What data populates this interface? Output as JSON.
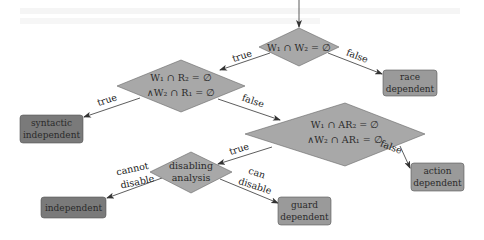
{
  "diagram": {
    "type": "decision-flowchart",
    "colors": {
      "diamond_fill": "#a8a8a8",
      "box_light_fill": "#9a9a9a",
      "box_dark_fill": "#7a7a7a",
      "stroke": "#555555",
      "edge": "#333333"
    },
    "decisions": {
      "d1": {
        "line1": "W₁ ∩ W₂ = ∅"
      },
      "d2": {
        "line1": "W₁ ∩ R₂ = ∅",
        "line2": "∧W₂ ∩ R₁ = ∅"
      },
      "d3": {
        "line1": "W₁ ∩ AR₂ = ∅",
        "line2": "∧W₂ ∩ AR₁ = ∅"
      },
      "d4": {
        "line1": "disabling",
        "line2": "analysis"
      }
    },
    "outcomes": {
      "race": {
        "line1": "race",
        "line2": "dependent"
      },
      "syntactic": {
        "line1": "syntactic",
        "line2": "independent"
      },
      "action": {
        "line1": "action",
        "line2": "dependent"
      },
      "independent": {
        "line1": "independent"
      },
      "guard": {
        "line1": "guard",
        "line2": "dependent"
      }
    },
    "edges": {
      "d1_true": "true",
      "d1_false": "false",
      "d2_true": "true",
      "d2_false": "false",
      "d3_true": "true",
      "d3_false": "false",
      "d4_cannot_1": "cannot",
      "d4_cannot_2": "disable",
      "d4_can_1": "can",
      "d4_can_2": "disable"
    }
  }
}
